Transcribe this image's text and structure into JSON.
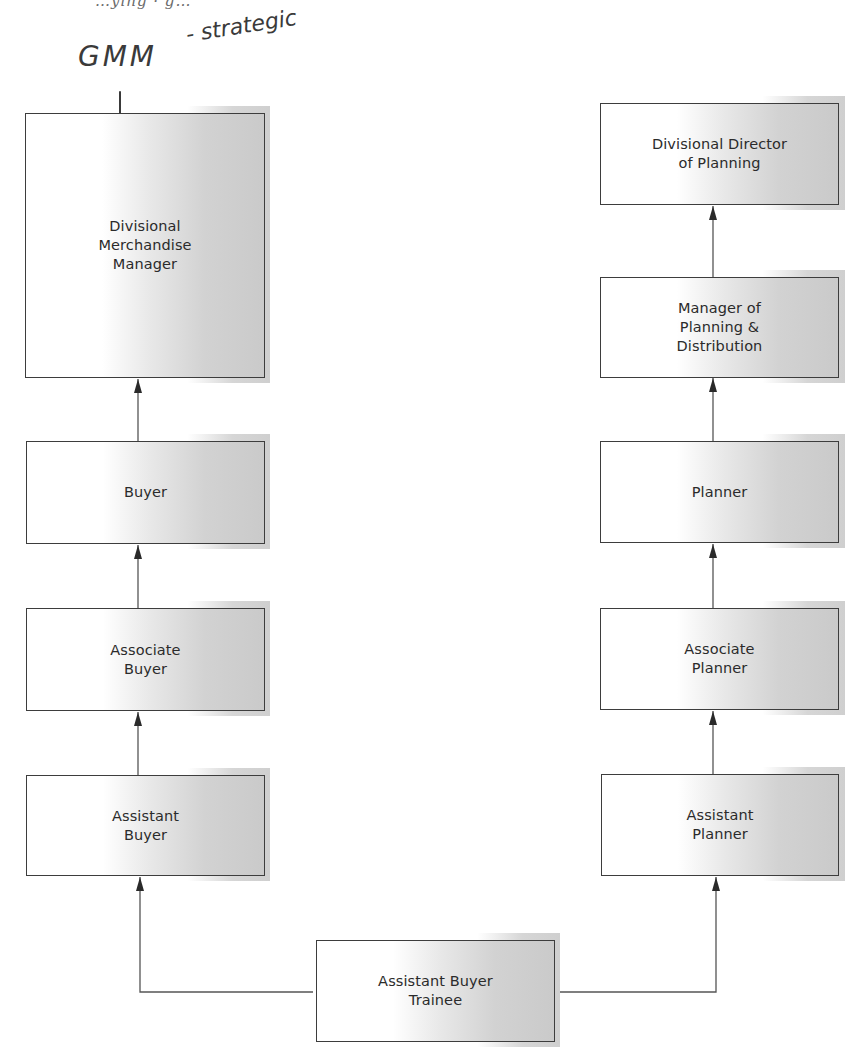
{
  "page": {
    "top_cutoff_text": "…ying · g…"
  },
  "annotations": {
    "handwritten_gmm": "GMM",
    "handwritten_strategic": "- strategic",
    "tick_mark": "|"
  },
  "diagram": {
    "left_column": {
      "boxes": [
        {
          "label": "Divisional\nMerchandise\nManager"
        },
        {
          "label": "Buyer"
        },
        {
          "label": "Associate\nBuyer"
        },
        {
          "label": "Assistant\nBuyer"
        }
      ]
    },
    "right_column": {
      "boxes": [
        {
          "label": "Divisional Director\nof Planning"
        },
        {
          "label": "Manager of\nPlanning &\nDistribution"
        },
        {
          "label": "Planner"
        },
        {
          "label": "Associate\nPlanner"
        },
        {
          "label": "Assistant\nPlanner"
        }
      ]
    },
    "root": {
      "label": "Assistant Buyer\nTrainee"
    },
    "colors": {
      "border": "#3d3d3d",
      "shade": "#cacaca",
      "text": "#2b2b2b"
    }
  }
}
